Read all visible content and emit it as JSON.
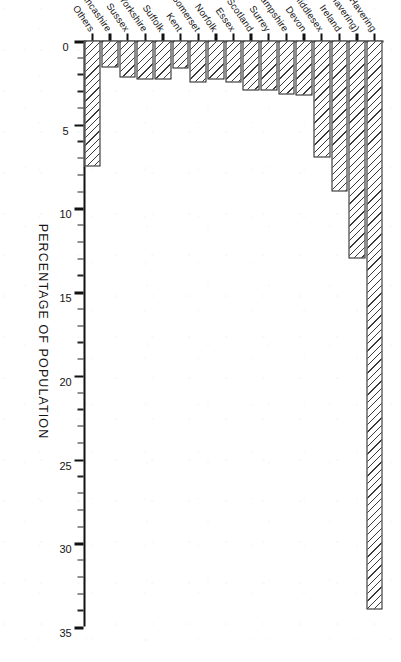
{
  "chart_data": {
    "type": "bar",
    "orientation": "vertical-rotated-90",
    "title": "",
    "xlabel": "",
    "ylabel": "PERCENTAGE OF POPULATION",
    "ylim": [
      0,
      35
    ],
    "ytick_labels": [
      "0",
      "5",
      "10",
      "15",
      "20",
      "25",
      "30",
      "35"
    ],
    "ytick_values": [
      0,
      5,
      10,
      15,
      20,
      25,
      30,
      35
    ],
    "minor_tick_step": 1,
    "grid": false,
    "legend": null,
    "categories": [
      "Havering",
      "Kent (ex. Havering)",
      "Ireland",
      "Middlesex",
      "Devon",
      "Hampshire",
      "Surrey",
      "Scotland",
      "Essex",
      "Norfolk",
      "Somerset",
      "Kent",
      "Suffolk",
      "Yorkshire",
      "Sussex",
      "Lancashire",
      "Others"
    ],
    "values": [
      34.0,
      13.0,
      9.0,
      7.0,
      3.3,
      3.2,
      3.0,
      3.0,
      2.5,
      2.3,
      2.5,
      1.7,
      2.3,
      2.3,
      2.2,
      1.6,
      7.5
    ]
  },
  "axis": {
    "value_axis_title": "PERCENTAGE OF POPULATION"
  }
}
